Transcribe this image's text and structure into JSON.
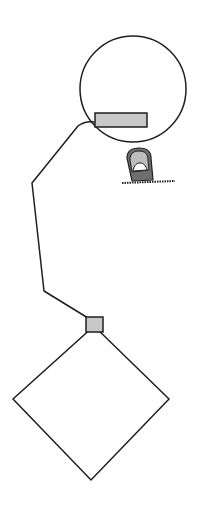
{
  "diagram": {
    "colors": {
      "stroke": "#1f1f1f",
      "fill_grey": "#c8c8c8",
      "finger_dark": "#6e6e6e",
      "finger_light": "#bdbdbd",
      "background": "#ffffff"
    },
    "shapes": {
      "circle": {
        "cx": 133,
        "cy": 89,
        "r": 53
      },
      "rectangle": {
        "x": 95,
        "y": 113,
        "width": 52,
        "height": 14
      },
      "connector_square": {
        "x": 86,
        "y": 317,
        "width": 17,
        "height": 15
      },
      "diamond": {
        "top": [
          94,
          326
        ],
        "right": [
          169,
          399
        ],
        "bottom": [
          91,
          480
        ],
        "left": [
          13,
          399
        ]
      },
      "finger": {
        "x": 126,
        "y": 149,
        "width": 27,
        "height": 32
      },
      "ground_line": {
        "x1": 122,
        "x2": 175,
        "y": 183
      }
    },
    "icons": [
      "finger-press-icon"
    ]
  }
}
